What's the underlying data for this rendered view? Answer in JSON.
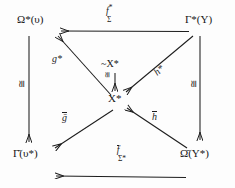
{
  "diagram": {
    "type": "commutative-diagram",
    "ink_color": "#1d1d1d",
    "background": "#fdfdfd",
    "nodes": [
      {
        "id": "top-left",
        "label": "Ω*(υ)",
        "base": "Ω",
        "star": "*",
        "arg": "(υ)"
      },
      {
        "id": "top-right",
        "label": "Γ*(Υ)",
        "base": "Γ",
        "star": "*",
        "arg": "(Υ)"
      },
      {
        "id": "center",
        "label": "X*",
        "base": "X",
        "star": "*",
        "arg": ""
      },
      {
        "id": "center-upper",
        "label": "~X*",
        "base": "X",
        "star": "*",
        "arg": ""
      },
      {
        "id": "bottom-left",
        "label": "Γ̄(υ*)",
        "base": "Γ",
        "star": "",
        "arg": "(υ*)"
      },
      {
        "id": "bottom-right",
        "label": "Ω̄(Υ*)",
        "base": "Ω",
        "star": "",
        "arg": "(Υ*)"
      }
    ],
    "edge_labels": {
      "top": {
        "main": "f",
        "sup": "*",
        "sub": "Σ"
      },
      "bottom": {
        "main": "f",
        "sub": "Σ*"
      },
      "left_vertical": {
        "main": "≅"
      },
      "right_vertical": {
        "main": "≅"
      },
      "center_vertical": {
        "main": "≅"
      },
      "upper_left_diag": {
        "main": "g*"
      },
      "upper_right_diag": {
        "main": "h*"
      },
      "lower_left_diag": {
        "main": "ḡ"
      },
      "lower_right_diag": {
        "main": "h̄"
      }
    },
    "node_texts": {
      "top_left": "Ω*(υ)",
      "top_right": "Γ*(Υ)",
      "center": "X*",
      "center_upper": "~X*",
      "bottom_left": "Γ̄(υ*)",
      "bottom_right": "Ω̄(Υ*)"
    },
    "glyphs": {
      "omega": "Ω",
      "gamma": "Γ",
      "upsilon_lower": "υ",
      "upsilon_upper": "Υ",
      "sigma": "Σ",
      "star": "*",
      "tilde": "~",
      "cong": "≅",
      "X": "X",
      "f": "f",
      "g": "g",
      "h": "h"
    }
  }
}
